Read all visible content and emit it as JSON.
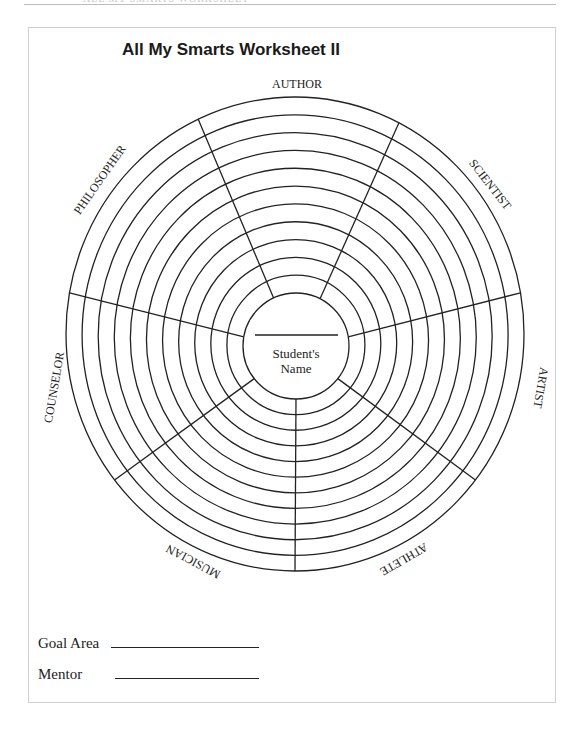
{
  "header": {
    "clipped_text": "· · ·  ALL MY SMARTS WORKSHEET"
  },
  "worksheet": {
    "title": "All My Smarts Worksheet II",
    "center": {
      "line1": "Student's",
      "line2": "Name"
    },
    "segments": [
      {
        "label": "AUTHOR"
      },
      {
        "label": "SCIENTIST"
      },
      {
        "label": "ARTIST"
      },
      {
        "label": "ATHLETE"
      },
      {
        "label": "MUSICIAN"
      },
      {
        "label": "COUNSELOR"
      },
      {
        "label": "PHILOSOPHER"
      }
    ],
    "ring_count": 11
  },
  "form": {
    "goal_area_label": "Goal Area",
    "goal_area_value": "",
    "mentor_label": "Mentor",
    "mentor_value": ""
  },
  "colors": {
    "ink": "#222222",
    "frame": "#cfcfcf"
  }
}
